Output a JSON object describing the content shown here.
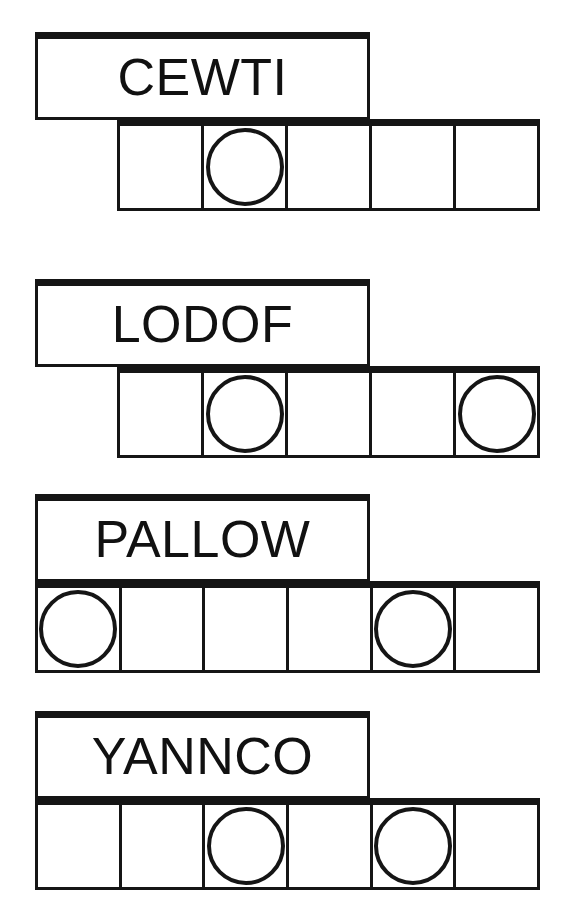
{
  "page": {
    "background_color": "#ffffff",
    "ink_color": "#151515",
    "width": 585,
    "height": 915
  },
  "groups": [
    {
      "id": "group-1",
      "word": "CEWTI",
      "word_box": {
        "x": 35,
        "y": 32,
        "width": 335,
        "height": 88
      },
      "word_font_size": 52,
      "grid": {
        "x": 117,
        "y": 119,
        "width": 423,
        "height": 92,
        "cell_count": 5,
        "circle_cells": [
          2
        ],
        "circle_diameter": 78
      }
    },
    {
      "id": "group-2",
      "word": "LODOF",
      "word_box": {
        "x": 35,
        "y": 279,
        "width": 335,
        "height": 88
      },
      "word_font_size": 52,
      "grid": {
        "x": 117,
        "y": 366,
        "width": 423,
        "height": 92,
        "cell_count": 5,
        "circle_cells": [
          2,
          5
        ],
        "circle_diameter": 78
      }
    },
    {
      "id": "group-3",
      "word": "PALLOW",
      "word_box": {
        "x": 35,
        "y": 494,
        "width": 335,
        "height": 88
      },
      "word_font_size": 52,
      "grid": {
        "x": 35,
        "y": 581,
        "width": 505,
        "height": 92,
        "cell_count": 6,
        "circle_cells": [
          1,
          5
        ],
        "circle_diameter": 78
      }
    },
    {
      "id": "group-4",
      "word": "YANNCO",
      "word_box": {
        "x": 35,
        "y": 711,
        "width": 335,
        "height": 88
      },
      "word_font_size": 52,
      "grid": {
        "x": 35,
        "y": 798,
        "width": 505,
        "height": 92,
        "cell_count": 6,
        "circle_cells": [
          3,
          5
        ],
        "circle_diameter": 78
      }
    }
  ]
}
